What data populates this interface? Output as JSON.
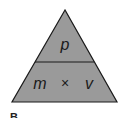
{
  "diagram": {
    "type": "formula-triangle",
    "top": "p",
    "bottom_left": "m",
    "operator": "×",
    "bottom_right": "v",
    "figure_label": "B",
    "fill_color": "#9a9a9a",
    "stroke_color": "#1a1a1a"
  }
}
